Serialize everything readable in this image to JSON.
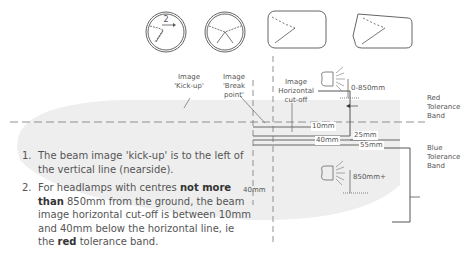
{
  "diagram": {
    "beam_pattern_icons": [
      {
        "id": "round-lamp-left",
        "badge": "2"
      },
      {
        "id": "round-lamp-symmetric",
        "badge": ""
      },
      {
        "id": "rect-lamp",
        "badge": ""
      },
      {
        "id": "trapezoid-lamp",
        "badge": ""
      }
    ],
    "labels": {
      "kick_up": [
        "Image",
        "'Kick-up'"
      ],
      "break_point": [
        "Image",
        "'Break",
        "point'"
      ],
      "horizontal_cutoff": [
        "Image",
        "Horizontal",
        "cut-off"
      ],
      "red_band": [
        "Red",
        "Tolerance",
        "Band"
      ],
      "blue_band": [
        "Blue",
        "Tolerance",
        "Band"
      ],
      "lamp_low": "0-850mm",
      "lamp_high": "850mm+",
      "dim_10": "10mm",
      "dim_25": "25mm",
      "dim_40": "40mm",
      "dim_55": "55mm",
      "dim_vertical_40": "40mm"
    },
    "colors": {
      "line": "#666666",
      "beam_fill": "#ececec",
      "text": "#555555"
    }
  },
  "notes": [
    {
      "number": "1.",
      "parts": [
        {
          "text": "The beam image 'kick-up' is to the left of the vertical line (nearside).",
          "bold": false
        }
      ]
    },
    {
      "number": "2.",
      "parts": [
        {
          "text": "For headlamps with centres ",
          "bold": false
        },
        {
          "text": "not more than",
          "bold": true
        },
        {
          "text": " 850mm from the ground, the beam image horizontal cut-off is between 10mm and 40mm below the horizontal line, ie the ",
          "bold": false
        },
        {
          "text": "red",
          "bold": true
        },
        {
          "text": " tolerance band.",
          "bold": false
        }
      ]
    }
  ]
}
